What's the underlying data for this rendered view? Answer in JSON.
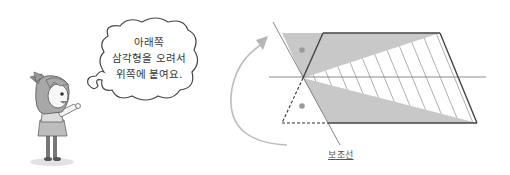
{
  "speech_bubble": {
    "lines": [
      "아래쪽",
      "삼각형을 오려서",
      "위쪽에 붙여요."
    ]
  },
  "diagram": {
    "aux_line_label": "보조선",
    "colors": {
      "gray_fill": "#c8c8c8",
      "outline": "#444444",
      "guide_line": "#8a8a8a",
      "arrow": "#b5b5b5",
      "dot": "#9a9a9a",
      "hatch": "#9a9a9a"
    }
  }
}
